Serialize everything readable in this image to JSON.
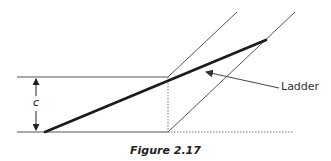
{
  "figure": {
    "caption": "Figure 2.17",
    "dimension_label": "c",
    "ladder_label": "Ladder",
    "colors": {
      "line": "#555555",
      "ladder": "#1a1a1a",
      "dotted": "#777777",
      "text": "#222222"
    },
    "elements": {
      "top_horizontal": {
        "x1": 17,
        "y1": 77,
        "x2": 168,
        "y2": 77
      },
      "bottom_horizontal_solid": {
        "x1": 17,
        "y1": 132,
        "x2": 168,
        "y2": 132
      },
      "bottom_horizontal_dotted": {
        "x1": 168,
        "y1": 132,
        "x2": 293,
        "y2": 132
      },
      "vertical_dotted": {
        "x1": 168,
        "y1": 77,
        "x2": 168,
        "y2": 132
      },
      "left_diagonal": {
        "x1": 168,
        "y1": 77,
        "x2": 237,
        "y2": 12
      },
      "right_diagonal": {
        "x1": 168,
        "y1": 132,
        "x2": 295,
        "y2": 12
      },
      "ladder": {
        "x1": 45,
        "y1": 132,
        "x2": 266,
        "y2": 40
      },
      "dimension_arrow": {
        "x": 36,
        "y_top": 77,
        "y_bottom": 132
      },
      "ladder_pointer": {
        "x1": 280,
        "y1": 88,
        "x2": 205,
        "y2": 72
      }
    }
  }
}
